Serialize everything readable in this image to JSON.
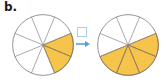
{
  "problem": {
    "label": "b.",
    "type": "equivalent-fractions-circle-model"
  },
  "answer_box": {
    "value": "",
    "placeholder": ""
  },
  "arrow": {
    "glyph": "right-arrow",
    "color": "#4aa3d8"
  },
  "colors": {
    "shaded_fill": "#f6c44a",
    "shaded_stroke": "#9b6a24",
    "circle_stroke": "#7a7a7a",
    "spoke_stroke": "#8a8a8a",
    "box_stroke": "#a9cfe3",
    "text": "#1a1a1a"
  },
  "chart_data": [
    {
      "type": "pie",
      "name": "left-fraction-circle",
      "title": "",
      "total_sectors": 8,
      "shaded_sectors": 2,
      "fraction": "2/8",
      "numerator": 2,
      "denominator": 8,
      "sector_angle_deg": 45,
      "start_angle_deg": -22.5,
      "shaded_indices": [
        0,
        1
      ],
      "categories": [
        "shaded",
        "unshaded"
      ],
      "values": [
        2,
        6
      ],
      "legend": false,
      "grid": false
    },
    {
      "type": "pie",
      "name": "right-fraction-circle",
      "title": "",
      "total_sectors": 8,
      "shaded_sectors": 4,
      "fraction": "4/8",
      "numerator": 4,
      "denominator": 8,
      "sector_angle_deg": 45,
      "start_angle_deg": -22.5,
      "shaded_indices": [
        0,
        1,
        2,
        3
      ],
      "categories": [
        "shaded",
        "unshaded"
      ],
      "values": [
        4,
        4
      ],
      "legend": false,
      "grid": false
    }
  ]
}
